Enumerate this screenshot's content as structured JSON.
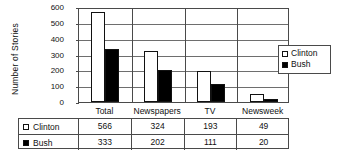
{
  "chart_data": {
    "type": "bar",
    "title": "",
    "xlabel": "",
    "ylabel": "Number of Stories",
    "ylim": [
      0,
      600
    ],
    "yticks": [
      0,
      100,
      200,
      300,
      400,
      500,
      600
    ],
    "grid": true,
    "legend_position": "right-outside",
    "categories": [
      "Total",
      "Newspapers",
      "TV",
      "Newsweek"
    ],
    "series": [
      {
        "name": "Clinton",
        "color": "#ffffff",
        "values": [
          566,
          324,
          193,
          49
        ]
      },
      {
        "name": "Bush",
        "color": "#000000",
        "values": [
          333,
          202,
          111,
          20
        ]
      }
    ]
  },
  "legend": {
    "items": [
      {
        "label": "Clinton",
        "swatch": "hollow-square-icon"
      },
      {
        "label": "Bush",
        "swatch": "filled-square-icon"
      }
    ]
  },
  "table": {
    "columns": [
      "Total",
      "Newspapers",
      "TV",
      "Newsweek"
    ],
    "rows": [
      {
        "label": "Clinton",
        "swatch": "hollow-square-icon",
        "values": [
          "566",
          "324",
          "193",
          "49"
        ]
      },
      {
        "label": "Bush",
        "swatch": "filled-square-icon",
        "values": [
          "333",
          "202",
          "111",
          "20"
        ]
      }
    ]
  }
}
